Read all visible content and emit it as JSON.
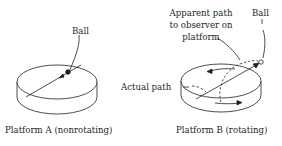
{
  "platform_a": {
    "caption": "Platform A (nonrotating)",
    "ball_label": "Ball"
  },
  "platform_b": {
    "caption": "Platform B (rotating)",
    "ball_label": "Ball",
    "apparent_path_line1": "Apparent path",
    "apparent_path_line2": "to observer on",
    "apparent_path_line3": "platform",
    "actual_path_label": "Actual path"
  },
  "colors": {
    "ink": "#231f20",
    "background": "#ffffff"
  }
}
